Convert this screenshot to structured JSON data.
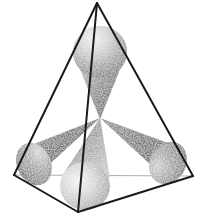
{
  "figure": {
    "background_color": "#ffffff",
    "width": 205,
    "height": 217,
    "edge_color": "#1a1a1a",
    "hidden_edge_color": "#9a9a9a",
    "cone_dark_color": "#6e6e6e",
    "cone_mid_color": "#8c8c8c",
    "cone_light_color": "#d8d8d8",
    "stipple_color": "#ffffff",
    "caption": ""
  },
  "tetrahedron": {
    "name": "tetrahedron-wireframe",
    "vertices": {
      "apex": {
        "label": "apex",
        "x": 97,
        "y": 3
      },
      "left": {
        "label": "back-left",
        "x": 14,
        "y": 175
      },
      "right": {
        "label": "back-right",
        "x": 193,
        "y": 176
      },
      "front": {
        "label": "front-bottom",
        "x": 78,
        "y": 212
      }
    },
    "visible_edges": [
      {
        "name": "edge-apex-left",
        "from": "apex",
        "to": "left"
      },
      {
        "name": "edge-apex-right",
        "from": "apex",
        "to": "right"
      },
      {
        "name": "edge-apex-front",
        "from": "apex",
        "to": "front"
      },
      {
        "name": "edge-left-front",
        "from": "left",
        "to": "front"
      },
      {
        "name": "edge-right-front",
        "from": "right",
        "to": "front"
      }
    ],
    "hidden_edges": [
      {
        "name": "edge-left-right",
        "from": "left",
        "to": "right"
      }
    ],
    "edge_width": 2.0,
    "hidden_edge_width": 0.9
  },
  "center_point": {
    "name": "cone-convergence-point",
    "x": 100,
    "y": 118
  },
  "cones": [
    {
      "name": "cone-up",
      "direction": "up",
      "apex": {
        "x": 100,
        "y": 118
      },
      "cap_center": {
        "x": 100,
        "y": 50
      },
      "cap_rx": 27,
      "cap_ry": 26,
      "cap_rotation": -2,
      "shade": "light-top"
    },
    {
      "name": "cone-down-left",
      "direction": "down-left",
      "apex": {
        "x": 100,
        "y": 118
      },
      "cap_center": {
        "x": 38,
        "y": 162
      },
      "cap_rx": 24,
      "cap_ry": 21,
      "cap_rotation": 35,
      "shade": "dark-left"
    },
    {
      "name": "cone-down-right",
      "direction": "down-right",
      "apex": {
        "x": 100,
        "y": 118
      },
      "cap_center": {
        "x": 166,
        "y": 161
      },
      "cap_rx": 25,
      "cap_ry": 22,
      "cap_rotation": -35,
      "shade": "dark-right"
    },
    {
      "name": "cone-down-front",
      "direction": "down-front",
      "apex": {
        "x": 100,
        "y": 118
      },
      "cap_center": {
        "x": 85,
        "y": 187
      },
      "cap_rx": 25,
      "cap_ry": 25,
      "cap_rotation": 8,
      "shade": "light-front"
    }
  ]
}
